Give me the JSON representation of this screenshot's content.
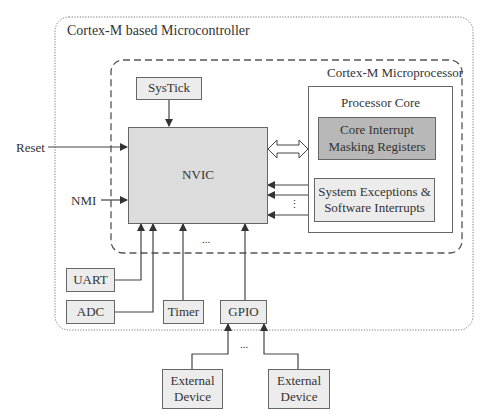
{
  "diagram": {
    "title": "Cortex-M based Microcontroller",
    "microprocessor_label": "Cortex-M Microprocessor",
    "processor_core_label": "Processor Core",
    "blocks": {
      "systick": "SysTick",
      "nvic": "NVIC",
      "core_masking_line1": "Core Interrupt",
      "core_masking_line2": "Masking Registers",
      "sys_exc_line1": "System Exceptions &",
      "sys_exc_line2": "Software Interrupts",
      "uart": "UART",
      "adc": "ADC",
      "timer": "Timer",
      "gpio": "GPIO",
      "ext1_line1": "External",
      "ext1_line2": "Device",
      "ext2_line1": "External",
      "ext2_line2": "Device"
    },
    "inputs": {
      "reset": "Reset",
      "nmi": "NMI"
    },
    "ellipsis_h": "...",
    "ellipsis_v": "⋮",
    "colors": {
      "nvic_fill": "#dcdcdc",
      "masking_fill": "#b8b8b8",
      "peripheral_fill": "#ececec",
      "line": "#555555"
    }
  }
}
